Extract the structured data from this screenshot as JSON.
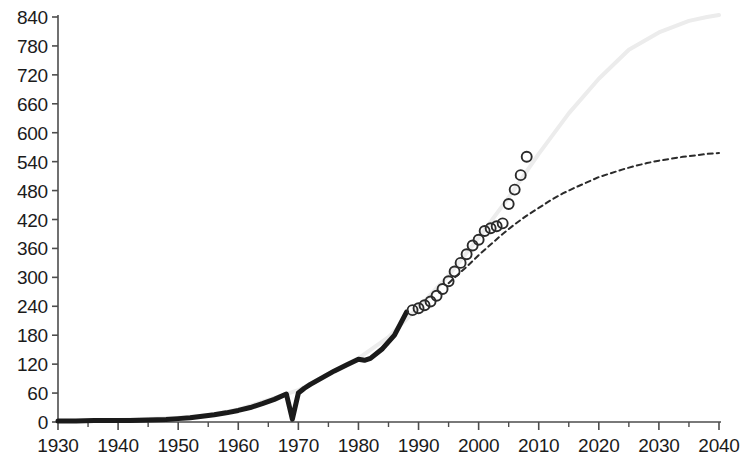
{
  "chart_data": {
    "type": "line",
    "title": "",
    "subtitle": "",
    "xlabel": "",
    "ylabel": "",
    "xlim": [
      1930,
      2040
    ],
    "ylim": [
      0,
      840
    ],
    "grid": false,
    "legend": false,
    "legend_position": "none",
    "x_ticks": [
      1930,
      1940,
      1950,
      1960,
      1970,
      1980,
      1990,
      2000,
      2010,
      2020,
      2030,
      2040
    ],
    "x_tick_labels": [
      "1930",
      "1940",
      "1950",
      "1960",
      "1970",
      "1980",
      "1990",
      "2000",
      "2010",
      "2020",
      "2030",
      "2040"
    ],
    "x_minor_tick_interval": 5,
    "y_ticks": [
      0,
      60,
      120,
      180,
      240,
      300,
      360,
      420,
      480,
      540,
      600,
      660,
      720,
      780,
      840
    ],
    "y_tick_labels": [
      "0",
      "60",
      "120",
      "180",
      "240",
      "300",
      "360",
      "420",
      "480",
      "540",
      "600",
      "660",
      "720",
      "780",
      "840"
    ],
    "colors": {
      "historical_line": "#1a1a1a",
      "marker_outline": "#2b2b2b",
      "projection_dashed": "#2b2b2b",
      "upper_envelope": "#ececec",
      "axis": "#4d4d4d",
      "background": "#ffffff"
    },
    "series": [
      {
        "name": "historical",
        "type": "line",
        "style": "solid-thick",
        "color": "#1a1a1a",
        "linewidth": 5,
        "x": [
          1930,
          1933,
          1936,
          1939,
          1942,
          1945,
          1948,
          1950,
          1952,
          1954,
          1956,
          1958,
          1960,
          1962,
          1964,
          1966,
          1968,
          1969,
          1970,
          1971,
          1972,
          1974,
          1976,
          1978,
          1980,
          1981,
          1982,
          1984,
          1986,
          1988
        ],
        "y": [
          2,
          2,
          3,
          3,
          3,
          4,
          5,
          7,
          9,
          12,
          15,
          19,
          24,
          30,
          38,
          47,
          58,
          6,
          60,
          70,
          78,
          92,
          106,
          118,
          130,
          128,
          132,
          152,
          180,
          228
        ]
      },
      {
        "name": "observations",
        "type": "scatter",
        "style": "open-circle",
        "color": "#2b2b2b",
        "marker_size": 10,
        "x": [
          1989,
          1990,
          1991,
          1992,
          1993,
          1994,
          1995,
          1996,
          1997,
          1998,
          1999,
          2000,
          2001,
          2002,
          2003,
          2004,
          2005,
          2006,
          2007,
          2008
        ],
        "y": [
          232,
          236,
          242,
          250,
          262,
          276,
          292,
          312,
          330,
          348,
          366,
          378,
          396,
          402,
          406,
          412,
          452,
          482,
          512,
          550
        ]
      },
      {
        "name": "projection",
        "type": "line",
        "style": "dashed",
        "color": "#2b2b2b",
        "linewidth": 2,
        "x": [
          1995,
          1998,
          2000,
          2002,
          2004,
          2006,
          2008,
          2010,
          2012,
          2014,
          2016,
          2018,
          2020,
          2022,
          2024,
          2026,
          2028,
          2030,
          2032,
          2034,
          2036,
          2038,
          2040
        ],
        "y": [
          288,
          322,
          346,
          368,
          390,
          410,
          428,
          444,
          460,
          474,
          486,
          497,
          508,
          516,
          524,
          531,
          537,
          542,
          546,
          550,
          553,
          556,
          558
        ]
      },
      {
        "name": "upper-envelope",
        "type": "line",
        "style": "solid-faint",
        "color": "#ececec",
        "linewidth": 4,
        "x": [
          1930,
          1940,
          1950,
          1955,
          1960,
          1965,
          1970,
          1975,
          1980,
          1985,
          1990,
          1995,
          2000,
          2005,
          2010,
          2015,
          2020,
          2025,
          2030,
          2035,
          2038,
          2040
        ],
        "y": [
          2,
          4,
          9,
          14,
          26,
          46,
          66,
          100,
          132,
          176,
          238,
          304,
          382,
          466,
          556,
          640,
          712,
          772,
          808,
          832,
          840,
          844
        ]
      }
    ]
  }
}
